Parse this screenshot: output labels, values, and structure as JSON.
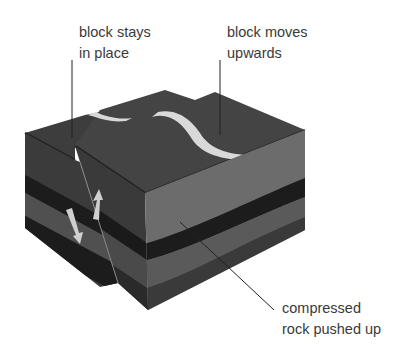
{
  "diagram": {
    "type": "reverse-fault-block-diagram",
    "labels": {
      "stays": {
        "line1": "block stays",
        "line2": "in place"
      },
      "moves": {
        "line1": "block moves",
        "line2": "upwards"
      },
      "compressed": {
        "line1": "compressed",
        "line2": "rock pushed up"
      }
    },
    "colors": {
      "top_surface": "#3d3d3d",
      "top_edge": "#1f1f1f",
      "light_layer": "#6c6c6c",
      "mid_layer": "#5a5a5a",
      "dark_layer": "#3b3b3b",
      "black_layer": "#1c1c1c",
      "vein": "#d9d9d9",
      "arrow": "#cfcfcf",
      "leader_line": "#222222",
      "text": "#3a3a3a"
    },
    "arrows": [
      {
        "name": "down-arrow",
        "direction": "down"
      },
      {
        "name": "up-arrow",
        "direction": "up"
      }
    ]
  }
}
